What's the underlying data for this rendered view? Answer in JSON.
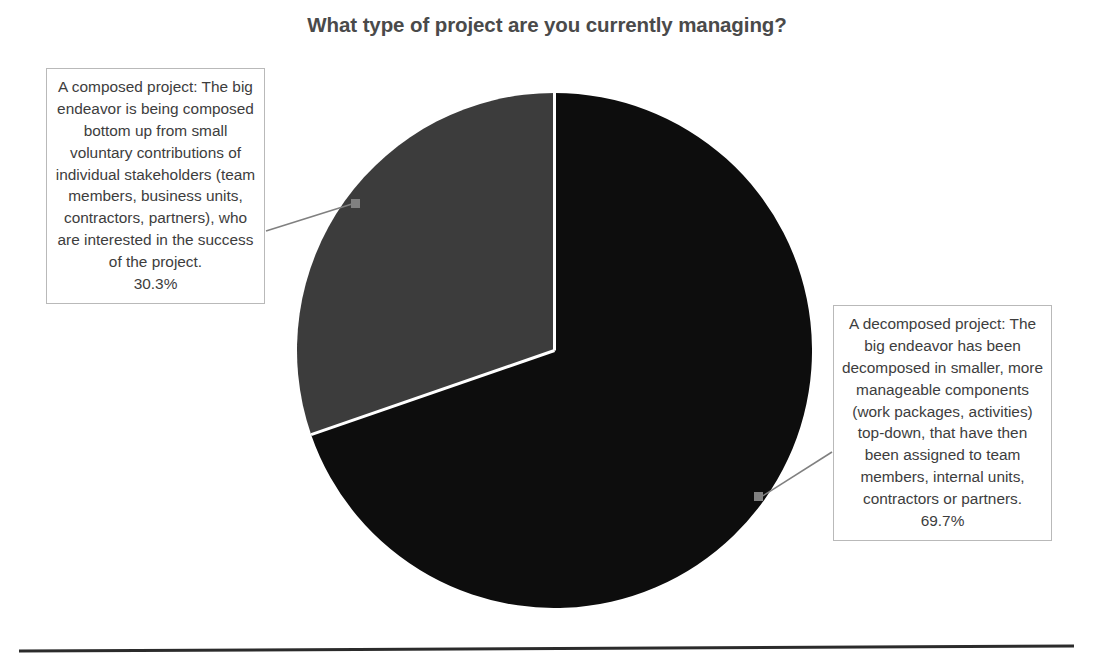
{
  "chart_data": {
    "type": "pie",
    "title": "What type of project are you currently managing?",
    "categories": [
      "A decomposed project: The big endeavor has been decomposed in smaller, more manageable components (work packages, activities) top-down, that have then been assigned to team members, internal units, contractors or partners.",
      "A composed project: The big endeavor is being composed bottom up from small voluntary contributions of individual stakeholders (team members, business units, contractors, partners), who are interested in the success of the project."
    ],
    "values": [
      69.7,
      30.3
    ],
    "value_labels": [
      "69.7%",
      "30.3%"
    ],
    "colors": [
      "#0d0d0d",
      "#3c3c3c"
    ],
    "legend": "none",
    "labels_position": "outside-callout-boxes",
    "start_angle_deg": 0,
    "direction": "clockwise",
    "grid": false
  },
  "title": {
    "text": "What type of project are you currently managing?"
  },
  "callouts": {
    "left": {
      "text": "A composed project: The big endeavor is being composed bottom up from small voluntary contributions of individual stakeholders (team members, business units, contractors, partners), who are interested in the success of the project.",
      "percent": "30.3%",
      "slice_color": "#3c3c3c"
    },
    "right": {
      "text": "A decomposed project: The big endeavor has been decomposed in smaller, more manageable components (work packages, activities) top-down, that have then been assigned to team members, internal units, contractors or partners.",
      "percent": "69.7%",
      "slice_color": "#0d0d0d"
    }
  },
  "style": {
    "background": "#ffffff",
    "text_color": "#3d3d3d",
    "title_color": "#4a4a4a",
    "box_border": "#b9b9b9",
    "leader_line": "#808080",
    "rule_color": "#2b2b2b",
    "slice_separator": "#ffffff"
  }
}
